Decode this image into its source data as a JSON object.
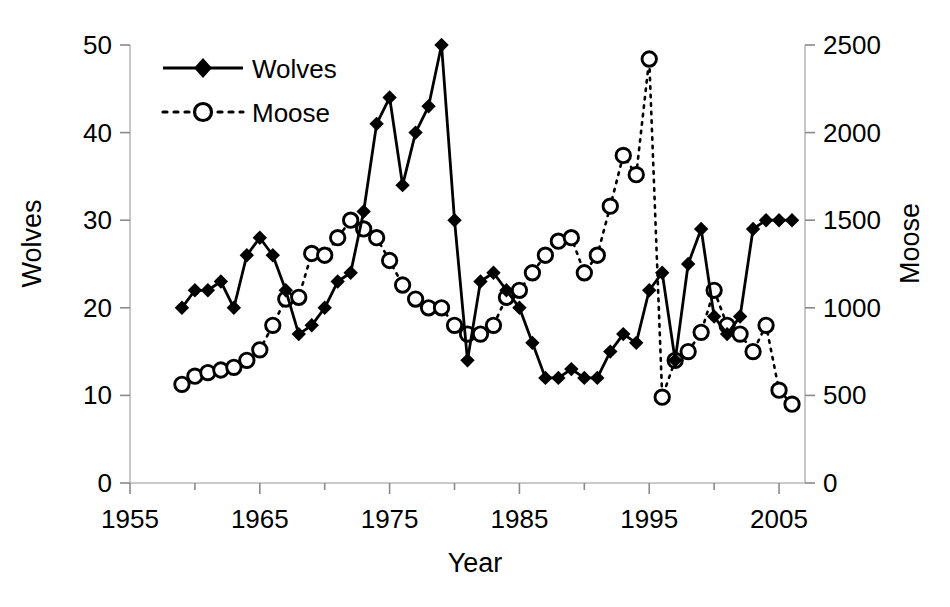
{
  "chart_data": {
    "type": "line",
    "title": "",
    "xlabel": "Year",
    "ylabel": "Wolves",
    "ylabel_right": "Moose",
    "xlim": [
      1955,
      2007
    ],
    "xticks": [
      1955,
      1965,
      1975,
      1985,
      1995,
      2005
    ],
    "xtick_labels": [
      "1955",
      "1965",
      "1975",
      "1985",
      "1995",
      "2005"
    ],
    "xminor_step": 5,
    "ylim": [
      0,
      50
    ],
    "yticks": [
      0,
      10,
      20,
      30,
      40,
      50
    ],
    "ytick_labels": [
      "0",
      "10",
      "20",
      "30",
      "40",
      "50"
    ],
    "ylim_right": [
      0,
      2500
    ],
    "yticks_right": [
      0,
      500,
      1000,
      1500,
      2000,
      2500
    ],
    "ytick_labels_right": [
      "0",
      "500",
      "1000",
      "1500",
      "2000",
      "2500"
    ],
    "grid": false,
    "legend_position": "top-left",
    "legend": [
      "Wolves",
      "Moose"
    ],
    "series": [
      {
        "name": "Wolves",
        "axis": "left",
        "marker": "filled-diamond",
        "linestyle": "solid",
        "color": "#000000",
        "x": [
          1959,
          1960,
          1961,
          1962,
          1963,
          1964,
          1965,
          1966,
          1967,
          1968,
          1969,
          1970,
          1971,
          1972,
          1973,
          1974,
          1975,
          1976,
          1977,
          1978,
          1979,
          1980,
          1981,
          1982,
          1983,
          1984,
          1985,
          1986,
          1987,
          1988,
          1989,
          1990,
          1991,
          1992,
          1993,
          1994,
          1995,
          1996,
          1997,
          1998,
          1999,
          2000,
          2001,
          2002,
          2003,
          2004,
          2005,
          2006
        ],
        "y": [
          20,
          22,
          22,
          23,
          20,
          26,
          28,
          26,
          22,
          17,
          18,
          20,
          23,
          24,
          31,
          41,
          44,
          34,
          40,
          43,
          50,
          30,
          14,
          23,
          24,
          22,
          20,
          16,
          12,
          12,
          13,
          12,
          12,
          15,
          17,
          16,
          22,
          24,
          14,
          25,
          29,
          19,
          17,
          19,
          29,
          30,
          30,
          30
        ],
        "y_note": "wolves counted on left axis (0-50)"
      },
      {
        "name": "Moose",
        "axis": "right",
        "marker": "open-circle",
        "linestyle": "dotted",
        "color": "#000000",
        "x": [
          1959,
          1960,
          1961,
          1962,
          1963,
          1964,
          1965,
          1966,
          1967,
          1968,
          1969,
          1970,
          1971,
          1972,
          1973,
          1974,
          1975,
          1976,
          1977,
          1978,
          1979,
          1980,
          1981,
          1982,
          1983,
          1984,
          1985,
          1986,
          1987,
          1988,
          1989,
          1990,
          1991,
          1992,
          1993,
          1994,
          1995,
          1996,
          1997,
          1998,
          1999,
          2000,
          2001,
          2002,
          2003,
          2004,
          2005,
          2006
        ],
        "y": [
          563,
          610,
          630,
          645,
          660,
          700,
          760,
          900,
          1050,
          1060,
          1310,
          1300,
          1400,
          1500,
          1450,
          1400,
          1270,
          1130,
          1050,
          1000,
          1000,
          900,
          850,
          850,
          900,
          1060,
          1100,
          1200,
          1300,
          1380,
          1400,
          1200,
          1300,
          1580,
          1870,
          1760,
          2420,
          490,
          700,
          750,
          860,
          1100,
          900,
          850,
          750,
          900,
          530,
          450
        ],
        "y_note": "moose counted on right axis (0-2500)"
      }
    ]
  },
  "figure": {
    "background": "#ffffff",
    "ink": "#000000"
  }
}
